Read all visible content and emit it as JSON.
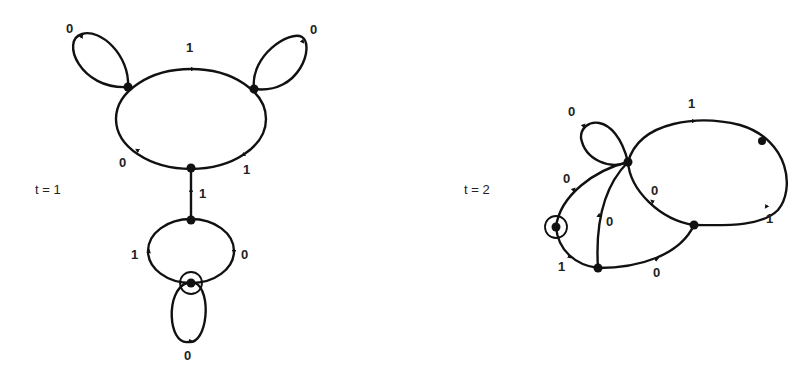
{
  "diagrams": [
    {
      "title": "t = 1",
      "nodes": [
        "A",
        "B",
        "C",
        "D",
        "S"
      ],
      "start_node": "S",
      "edges": [
        {
          "from": "A",
          "to": "A",
          "label": "0"
        },
        {
          "from": "A",
          "to": "B",
          "label": "1"
        },
        {
          "from": "B",
          "to": "B",
          "label": "0"
        },
        {
          "from": "B",
          "to": "C",
          "label": "1"
        },
        {
          "from": "C",
          "to": "A",
          "label": "0"
        },
        {
          "from": "D",
          "to": "C",
          "label": "1"
        },
        {
          "from": "S",
          "to": "D",
          "label": "1"
        },
        {
          "from": "D",
          "to": "S",
          "label": "0"
        },
        {
          "from": "S",
          "to": "S",
          "label": "0"
        }
      ],
      "labels": {
        "loop_a": "0",
        "top": "1",
        "loop_b": "0",
        "left_low": "0",
        "right_low": "1",
        "stem": "1",
        "small_left": "1",
        "small_right": "0",
        "bottom_loop": "0"
      }
    },
    {
      "title": "t = 2",
      "nodes": [
        "S",
        "P",
        "Q",
        "R",
        "T"
      ],
      "start_node": "S",
      "edges": [
        {
          "from": "S",
          "to": "P",
          "label": "0"
        },
        {
          "from": "S",
          "to": "Q",
          "label": "1"
        },
        {
          "from": "Q",
          "to": "P",
          "label": "0"
        },
        {
          "from": "Q",
          "to": "R",
          "label": "0"
        },
        {
          "from": "R",
          "to": "P",
          "label": "0"
        },
        {
          "from": "P",
          "to": "P",
          "label": "0"
        },
        {
          "from": "P",
          "to": "T",
          "label": "1"
        },
        {
          "from": "T",
          "to": "R",
          "label": "1"
        }
      ],
      "labels": {
        "loop_p": "0",
        "top": "1",
        "right": "1",
        "inner": "0",
        "s_up": "0",
        "mid": "0",
        "s_down": "1",
        "bottom": "0"
      }
    }
  ]
}
